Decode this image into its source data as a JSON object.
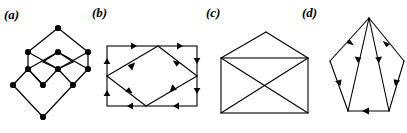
{
  "figure": {
    "caption_style": "bold-italic-parenthesized",
    "background_color": "#ffffff",
    "ink_color": "#000000",
    "width": 407,
    "height": 133,
    "panels": [
      {
        "id": "a",
        "label": "(a)",
        "kind": "lattice-hasse-diagram",
        "description": "Undirected lattice / Hasse diagram of overlapping diamonds with 11 filled vertex dots",
        "has_arrows": false,
        "vertex_count": 11,
        "edge_count": 16
      },
      {
        "id": "b",
        "label": "(b)",
        "kind": "directed-rectangle-with-inscribed-diamond",
        "description": "Rectangle with an inscribed diamond, arrowheads at the midpoint of every segment",
        "has_arrows": true,
        "vertex_count": 6,
        "edge_count": 10
      },
      {
        "id": "c",
        "label": "(c)",
        "kind": "envelope-graph",
        "description": "Rectangle with both diagonals and a triangular apex above the top edge",
        "has_arrows": false,
        "vertex_count": 5,
        "edge_count": 8
      },
      {
        "id": "d",
        "label": "(d)",
        "kind": "directed-pentagon-fan",
        "description": "Pentagon with internal edges fanning from the apex, arrowheads on every segment",
        "has_arrows": true,
        "vertex_count": 6,
        "edge_count": 8
      }
    ]
  },
  "graph_data": {
    "a": {
      "nodes": [
        {
          "id": "n0",
          "x": 52,
          "y": 6
        },
        {
          "id": "n1",
          "x": 22,
          "y": 30
        },
        {
          "id": "n2",
          "x": 52,
          "y": 30
        },
        {
          "id": "n3",
          "x": 82,
          "y": 30
        },
        {
          "id": "n4",
          "x": 22,
          "y": 47
        },
        {
          "id": "n5",
          "x": 52,
          "y": 47
        },
        {
          "id": "n6",
          "x": 82,
          "y": 47
        },
        {
          "id": "n7",
          "x": 7,
          "y": 63
        },
        {
          "id": "n8",
          "x": 37,
          "y": 63
        },
        {
          "id": "n9",
          "x": 67,
          "y": 63
        },
        {
          "id": "n10",
          "x": 37,
          "y": 95
        }
      ],
      "edges": [
        [
          "n0",
          "n1"
        ],
        [
          "n0",
          "n3"
        ],
        [
          "n1",
          "n4"
        ],
        [
          "n3",
          "n6"
        ],
        [
          "n2",
          "n1"
        ],
        [
          "n2",
          "n3"
        ],
        [
          "n2",
          "n4"
        ],
        [
          "n2",
          "n6"
        ],
        [
          "n4",
          "n5"
        ],
        [
          "n5",
          "n6"
        ],
        [
          "n5",
          "n2"
        ],
        [
          "n5",
          "n8"
        ],
        [
          "n4",
          "n8"
        ],
        [
          "n6",
          "n9"
        ],
        [
          "n7",
          "n4"
        ],
        [
          "n7",
          "n10"
        ],
        [
          "n8",
          "n9"
        ],
        [
          "n9",
          "n10"
        ]
      ]
    },
    "b": {
      "nodes": [
        {
          "id": "tl",
          "x": 6,
          "y": 18
        },
        {
          "id": "tr",
          "x": 96,
          "y": 18
        },
        {
          "id": "br",
          "x": 96,
          "y": 78
        },
        {
          "id": "bl",
          "x": 6,
          "y": 78
        },
        {
          "id": "dt",
          "x": 57,
          "y": 18
        },
        {
          "id": "db",
          "x": 45,
          "y": 78
        },
        {
          "id": "dl",
          "x": 6,
          "y": 48
        },
        {
          "id": "dr",
          "x": 96,
          "y": 48
        }
      ],
      "arrows": [
        {
          "from": "tl",
          "to": "tr",
          "direction": "right"
        },
        {
          "from": "tr",
          "to": "br",
          "direction": "down"
        },
        {
          "from": "br",
          "to": "bl",
          "direction": "left"
        },
        {
          "from": "bl",
          "to": "tl",
          "direction": "up"
        },
        {
          "from": "dt",
          "to": "dr",
          "direction": "down-right"
        },
        {
          "from": "dr",
          "to": "db",
          "direction": "down-left"
        },
        {
          "from": "db",
          "to": "dl",
          "direction": "up-left"
        },
        {
          "from": "dl",
          "to": "dt",
          "direction": "up-right"
        }
      ]
    },
    "c": {
      "nodes": [
        {
          "id": "apex",
          "x": 50,
          "y": 5
        },
        {
          "id": "tl",
          "x": 5,
          "y": 31
        },
        {
          "id": "tr",
          "x": 92,
          "y": 31
        },
        {
          "id": "bl",
          "x": 5,
          "y": 86
        },
        {
          "id": "br",
          "x": 92,
          "y": 86
        }
      ],
      "edges": [
        [
          "apex",
          "tl"
        ],
        [
          "apex",
          "tr"
        ],
        [
          "tl",
          "tr"
        ],
        [
          "tr",
          "br"
        ],
        [
          "br",
          "bl"
        ],
        [
          "bl",
          "tl"
        ],
        [
          "tl",
          "br"
        ],
        [
          "tr",
          "bl"
        ]
      ]
    },
    "d": {
      "nodes": [
        {
          "id": "apex",
          "x": 45,
          "y": 4
        },
        {
          "id": "ul",
          "x": 6,
          "y": 47
        },
        {
          "id": "ur",
          "x": 80,
          "y": 47
        },
        {
          "id": "ll",
          "x": 24,
          "y": 97
        },
        {
          "id": "lr",
          "x": 65,
          "y": 97
        },
        {
          "id": "im",
          "x": 20,
          "y": 97
        }
      ],
      "arrows": [
        {
          "from": "apex",
          "to": "ul",
          "direction": "down-left"
        },
        {
          "from": "apex",
          "to": "ur",
          "direction": "down-right"
        },
        {
          "from": "apex",
          "to": "ll",
          "direction": "down-left"
        },
        {
          "from": "apex",
          "to": "lr",
          "direction": "down-right"
        },
        {
          "from": "ul",
          "to": "ll",
          "direction": "down-right"
        },
        {
          "from": "ur",
          "to": "lr",
          "direction": "down-left"
        },
        {
          "from": "lr",
          "to": "ll",
          "direction": "left"
        }
      ]
    }
  }
}
